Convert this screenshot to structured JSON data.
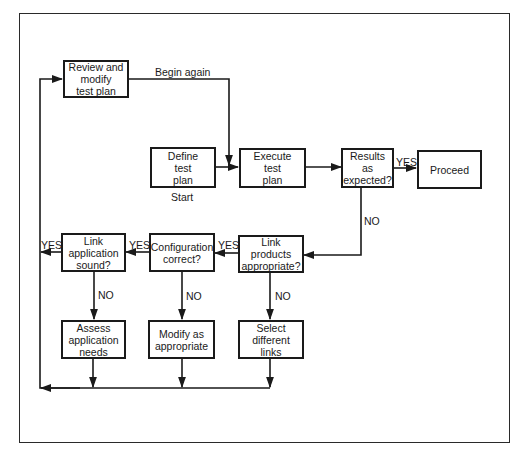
{
  "diagram": {
    "type": "flowchart",
    "nodes": [
      {
        "id": "review",
        "text": "Review and\nmodify\ntest plan"
      },
      {
        "id": "define",
        "text": "Define\ntest\nplan"
      },
      {
        "id": "execute",
        "text": "Execute\ntest\nplan"
      },
      {
        "id": "results",
        "text": "Results as\nexpected?"
      },
      {
        "id": "proceed",
        "text": "Proceed"
      },
      {
        "id": "link_products",
        "text": "Link products\nappropriate?"
      },
      {
        "id": "configuration",
        "text": "Configuration\ncorrect?"
      },
      {
        "id": "link_application",
        "text": "Link\napplication\nsound?"
      },
      {
        "id": "assess",
        "text": "Assess\napplication\nneeds"
      },
      {
        "id": "modify",
        "text": "Modify as\nappropriate"
      },
      {
        "id": "select",
        "text": "Select\ndifferent\nlinks"
      }
    ],
    "labels": {
      "begin_again": "Begin again",
      "start": "Start",
      "results_yes": "YES",
      "results_no": "NO",
      "link_products_yes": "YES",
      "link_products_no": "NO",
      "configuration_yes": "YES",
      "configuration_no": "NO",
      "link_application_yes": "YES",
      "link_application_no": "NO"
    },
    "edges": [
      {
        "from": "review",
        "to": "execute",
        "label": "Begin again"
      },
      {
        "from": "define",
        "to": "execute"
      },
      {
        "from": "execute",
        "to": "results"
      },
      {
        "from": "results",
        "to": "proceed",
        "label": "YES"
      },
      {
        "from": "results",
        "to": "link_products",
        "label": "NO"
      },
      {
        "from": "link_products",
        "to": "configuration",
        "label": "YES"
      },
      {
        "from": "link_products",
        "to": "select",
        "label": "NO"
      },
      {
        "from": "configuration",
        "to": "link_application",
        "label": "YES"
      },
      {
        "from": "configuration",
        "to": "modify",
        "label": "NO"
      },
      {
        "from": "link_application",
        "to": "review",
        "label": "YES"
      },
      {
        "from": "link_application",
        "to": "assess",
        "label": "NO"
      },
      {
        "from": "assess",
        "to": "review"
      },
      {
        "from": "modify",
        "to": "review"
      },
      {
        "from": "select",
        "to": "review"
      }
    ]
  }
}
